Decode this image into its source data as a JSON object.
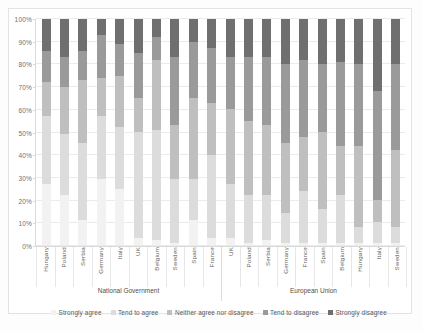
{
  "chart_data": {
    "type": "bar",
    "subtype": "100% stacked column",
    "title": "",
    "xlabel": "",
    "ylabel": "",
    "ylim": [
      0,
      100
    ],
    "ytick_labels": [
      "0%",
      "10%",
      "20%",
      "30%",
      "40%",
      "50%",
      "60%",
      "70%",
      "80%",
      "90%",
      "100%"
    ],
    "ytick_values": [
      0,
      10,
      20,
      30,
      40,
      50,
      60,
      70,
      80,
      90,
      100
    ],
    "grid": true,
    "legend_position": "bottom",
    "stack_order_bottom_to_top": [
      "Strongly agree",
      "Tend to agree",
      "Neither agree nor disagree",
      "Tend to disagree",
      "Strongly disagree"
    ],
    "series": [
      {
        "name": "Strongly agree",
        "color": "#f2f2f2",
        "values": [
          27,
          22,
          11,
          29,
          25,
          3,
          2,
          1,
          11,
          3,
          3,
          1,
          2,
          1,
          1,
          1,
          1,
          1,
          1,
          1
        ]
      },
      {
        "name": "Tend to agree",
        "color": "#dcdcdc",
        "values": [
          30,
          27,
          34,
          28,
          27,
          47,
          49,
          28,
          18,
          37,
          24,
          21,
          20,
          13,
          23,
          15,
          21,
          7,
          9,
          7
        ]
      },
      {
        "name": "Neither agree nor disagree",
        "color": "#bfbfbf",
        "values": [
          15,
          21,
          28,
          17,
          23,
          15,
          31,
          24,
          36,
          23,
          33,
          33,
          31,
          31,
          24,
          34,
          22,
          36,
          10,
          34
        ]
      },
      {
        "name": "Tend to disagree",
        "color": "#9a9a9a",
        "values": [
          14,
          13,
          13,
          19,
          14,
          20,
          10,
          30,
          25,
          24,
          23,
          28,
          30,
          35,
          34,
          30,
          37,
          36,
          48,
          38
        ]
      },
      {
        "name": "Strongly disagree",
        "color": "#6f6f6f",
        "values": [
          14,
          17,
          14,
          7,
          11,
          15,
          8,
          17,
          10,
          13,
          17,
          17,
          17,
          20,
          18,
          20,
          19,
          20,
          32,
          20
        ]
      }
    ],
    "groups": [
      {
        "label": "National Government",
        "categories": [
          "Hungary",
          "Poland",
          "Serbia",
          "Germany",
          "Italy",
          "UK",
          "Belgium",
          "Sweden",
          "Spain",
          "France"
        ]
      },
      {
        "label": "European Union",
        "categories": [
          "UK",
          "Poland",
          "Serbia",
          "Germany",
          "France",
          "Spain",
          "Belgium",
          "Hungary",
          "Italy",
          "Sweden"
        ]
      }
    ],
    "categories": [
      "Hungary",
      "Poland",
      "Serbia",
      "Germany",
      "Italy",
      "UK",
      "Belgium",
      "Sweden",
      "Spain",
      "France",
      "UK",
      "Poland",
      "Serbia",
      "Germany",
      "France",
      "Spain",
      "Belgium",
      "Hungary",
      "Italy",
      "Sweden"
    ]
  },
  "legend": {
    "items": [
      {
        "label": "Strongly agree",
        "color": "#f2f2f2"
      },
      {
        "label": "Tend to agree",
        "color": "#dcdcdc"
      },
      {
        "label": "Neither agree nor disagree",
        "color": "#bfbfbf"
      },
      {
        "label": "Tend to disagree",
        "color": "#9a9a9a"
      },
      {
        "label": "Strongly disagree",
        "color": "#6f6f6f"
      }
    ]
  }
}
